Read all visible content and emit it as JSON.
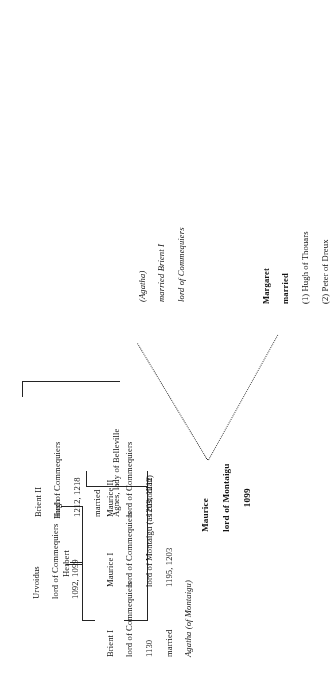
{
  "document": {
    "kind": "genealogical-tree",
    "orientation": "rotated-90-ccw",
    "ink_color": "#1a1a1a",
    "paper_color": "#ffffff"
  },
  "nodes": {
    "maurice_montaigu": {
      "name": "Maurice",
      "title": "lord of Montaigu",
      "dates": "1099"
    },
    "agatha_branch": {
      "name": "(Agatha)",
      "married": "married Brient I",
      "title": "lord of Commequiers"
    },
    "margaret": {
      "name": "Margaret",
      "married": "married",
      "spouse1": "(1) Hugh of Thouars",
      "spouse2": "(2) Peter of Dreux"
    },
    "urvoidus": {
      "name": "Urvoidus",
      "title": "lord of Commequiers",
      "dates": "1092, 1099"
    },
    "hugh": {
      "name": "Hugh"
    },
    "herbert": {
      "name": "Herbert"
    },
    "brient_i": {
      "name": "Brient I",
      "title": "lord of Commequiers",
      "dates": "1130",
      "married": "married",
      "spouse": "Agatha (of Montaigu)"
    },
    "maurice_i": {
      "name": "Maurice I",
      "title1": "lord of Commequiers",
      "title2": "lord of Montaigu (as custodian)",
      "dates": "1195, 1203"
    },
    "maurice_ii": {
      "name": "Maurice II",
      "title": "lord of Commequiers",
      "dates": "1203, 1212"
    },
    "brient_ii": {
      "name": "Brient II",
      "title": "lord of Commequiers",
      "dates": "1212, 1218",
      "married": "married",
      "spouse": "Agnes, lady of Belleville"
    }
  }
}
